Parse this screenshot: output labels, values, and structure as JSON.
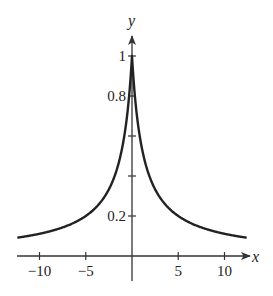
{
  "chart_data": {
    "type": "line",
    "title": "",
    "xlabel": "x",
    "ylabel": "y",
    "x_ticks": [
      -10,
      -5,
      5,
      10
    ],
    "x_tick_labels": [
      "−10",
      "−5",
      "5",
      "10"
    ],
    "y_ticks": [
      0.2,
      0.4,
      0.6,
      0.8,
      1
    ],
    "y_tick_labels": [
      "0.2",
      "",
      "",
      "0.8",
      "1"
    ],
    "xlim": [
      -12.4,
      12.4
    ],
    "ylim": [
      0,
      1.1
    ],
    "grid": false,
    "legend": null,
    "series": [
      {
        "name": "y",
        "description": "symmetric cusp peak at x=0, y=1; decays toward 0 as |x| grows (approx. y = 1/(1+0.8|x|))",
        "x": [
          -12.4,
          -10,
          -8,
          -6,
          -5,
          -4,
          -3,
          -2,
          -1.5,
          -1,
          -0.5,
          -0.2,
          0,
          0.2,
          0.5,
          1,
          1.5,
          2,
          3,
          4,
          5,
          6,
          8,
          10,
          12.4
        ],
        "y": [
          0.09,
          0.111,
          0.135,
          0.172,
          0.2,
          0.238,
          0.294,
          0.385,
          0.455,
          0.556,
          0.714,
          0.862,
          1,
          0.862,
          0.714,
          0.556,
          0.455,
          0.385,
          0.294,
          0.238,
          0.2,
          0.172,
          0.135,
          0.111,
          0.09
        ]
      }
    ]
  },
  "colors": {
    "curve": "#222222",
    "axes": "#333333",
    "background": "#ffffff"
  }
}
